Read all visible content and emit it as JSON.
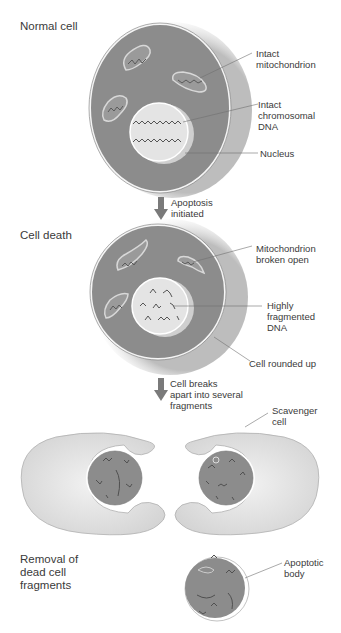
{
  "stages": [
    {
      "id": "normal",
      "title": "Normal cell"
    },
    {
      "id": "death",
      "title": "Cell death"
    },
    {
      "id": "removal",
      "title": "Removal of\ndead cell\nfragments"
    }
  ],
  "labels": {
    "intact_mito": "Intact\nmitochondrion",
    "intact_dna": "Intact\nchromosomal\nDNA",
    "nucleus": "Nucleus",
    "apoptosis": "Apoptosis\ninitiated",
    "mito_broken": "Mitochondrion\nbroken open",
    "frag_dna": "Highly\nfragmented\nDNA",
    "rounded": "Cell rounded up",
    "breaks": "Cell breaks\napart into several\nfragments",
    "scavenger": "Scavenger\ncell",
    "apoptotic_body": "Apoptotic\nbody"
  },
  "colors": {
    "cell_fill": "#8c8c8c",
    "cell_shadow": "#c8c8c8",
    "nucleus_fill": "#e4e4e4",
    "scavenger_fill": "#e2e2e2",
    "arrow": "#7a7a7a",
    "leader": "#707070"
  }
}
